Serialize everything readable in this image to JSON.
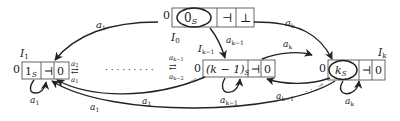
{
  "diagram": {
    "nodes": [
      {
        "id": "I0",
        "label": "I",
        "sub": "0",
        "prefix": "0",
        "cells": [
          "0",
          "⊣",
          "⊥"
        ],
        "cell_subs": [
          "S",
          "",
          ""
        ],
        "circled": 0
      },
      {
        "id": "I1",
        "label": "I",
        "sub": "1",
        "prefix": "0",
        "cells": [
          "1",
          "⊣",
          "0"
        ],
        "cell_subs": [
          "S",
          "",
          ""
        ],
        "circled": null
      },
      {
        "id": "Ik-1",
        "label": "I",
        "sub": "k−1",
        "prefix": "0",
        "cells": [
          "(k − 1)",
          "⊣",
          "0"
        ],
        "cell_subs": [
          "S",
          "",
          ""
        ],
        "circled": null
      },
      {
        "id": "Ik",
        "label": "I",
        "sub": "k",
        "prefix": "0",
        "cells": [
          "k",
          "⊣",
          "0"
        ],
        "cell_subs": [
          "S",
          "",
          ""
        ],
        "circled": 0
      }
    ],
    "edges": [
      {
        "from": "I0",
        "to": "I1",
        "label": "a",
        "sub": "1"
      },
      {
        "from": "I0",
        "to": "Ik",
        "label": "a",
        "sub": "k"
      },
      {
        "from": "I0",
        "to": "Ik-1",
        "label": "a",
        "sub": "k−1"
      },
      {
        "from": "Ik-1",
        "to": "Ik",
        "label": "a",
        "sub": "k"
      },
      {
        "from": "Ik",
        "to": "Ik-1",
        "label": "a",
        "sub": "k−1"
      },
      {
        "from": "I1",
        "to": "I1",
        "label": "a",
        "sub": "1"
      },
      {
        "from": "Ik-1",
        "to": "Ik-1",
        "label": "a",
        "sub": "k−1"
      },
      {
        "from": "Ik",
        "to": "Ik",
        "label": "a",
        "sub": "k"
      },
      {
        "from": "Ik-1",
        "to": "I1",
        "label": "a",
        "sub": "1"
      },
      {
        "from": "Ik",
        "to": "I1",
        "label": "a",
        "sub": "1"
      }
    ],
    "i1_side_labels": {
      "top": "a",
      "top_sub": "2",
      "bottom": "a",
      "bottom_sub": "1",
      "symbol": "⇄"
    },
    "ik1_side_labels": {
      "top": "a",
      "top_sub": "k−1",
      "bottom": "a",
      "bottom_sub": "k−2",
      "symbol": "⇄"
    },
    "ellipsis": "· · · · · · · · ·",
    "small_ellipsis": ". · ·"
  }
}
